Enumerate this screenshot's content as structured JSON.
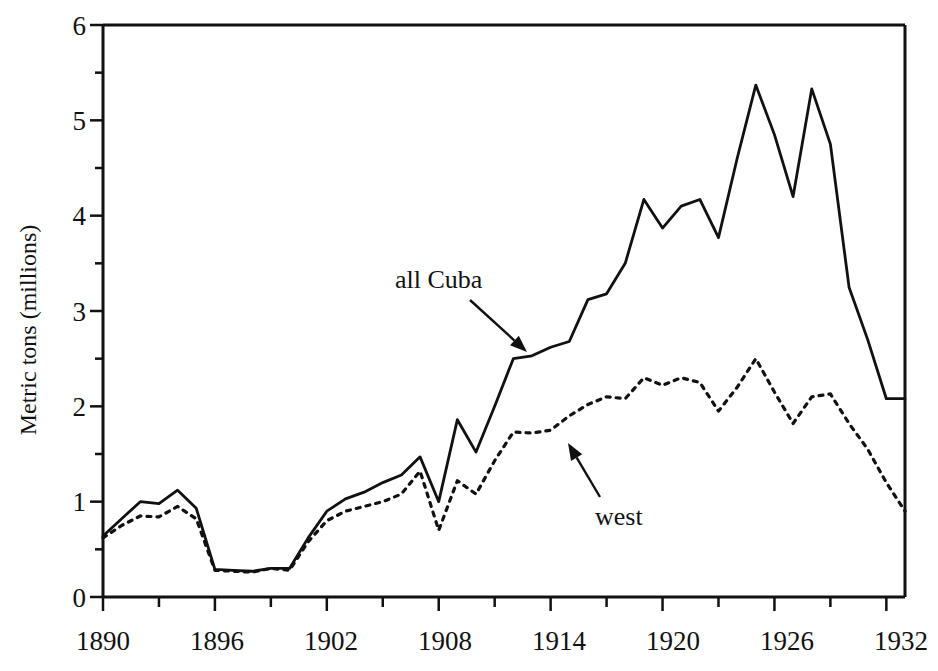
{
  "chart_data": {
    "type": "line",
    "title": "",
    "xlabel": "",
    "ylabel": "Metric tons (millions)",
    "xlim": [
      1890,
      1933
    ],
    "ylim": [
      0,
      6
    ],
    "grid": false,
    "legend_position": "inline-annotations",
    "x_major_ticks": [
      1890,
      1896,
      1902,
      1908,
      1914,
      1920,
      1926,
      1932
    ],
    "x_minor_tick_interval": 3,
    "y_major_ticks": [
      0,
      1,
      2,
      3,
      4,
      5,
      6
    ],
    "y_minor_tick_interval": 0.5,
    "x": [
      1890,
      1891,
      1892,
      1893,
      1894,
      1895,
      1896,
      1897,
      1898,
      1899,
      1900,
      1901,
      1902,
      1903,
      1904,
      1905,
      1906,
      1907,
      1908,
      1909,
      1910,
      1911,
      1912,
      1913,
      1914,
      1915,
      1916,
      1917,
      1918,
      1919,
      1920,
      1921,
      1922,
      1923,
      1924,
      1925,
      1926,
      1927,
      1928,
      1929,
      1930,
      1931,
      1932,
      1933
    ],
    "series": [
      {
        "name": "all Cuba",
        "style": "solid",
        "values": [
          0.64,
          0.82,
          1.0,
          0.98,
          1.12,
          0.93,
          0.29,
          0.28,
          0.27,
          0.3,
          0.3,
          0.62,
          0.9,
          1.03,
          1.1,
          1.2,
          1.28,
          1.47,
          1.0,
          1.86,
          1.52,
          2.0,
          2.5,
          2.53,
          2.62,
          2.68,
          3.12,
          3.18,
          3.5,
          4.17,
          3.87,
          4.1,
          4.17,
          3.77,
          4.6,
          5.37,
          4.85,
          4.2,
          5.33,
          4.75,
          3.25,
          2.7,
          2.08,
          2.08
        ]
      },
      {
        "name": "west",
        "style": "dotted",
        "values": [
          0.62,
          0.75,
          0.85,
          0.84,
          0.95,
          0.82,
          0.28,
          0.27,
          0.26,
          0.3,
          0.28,
          0.58,
          0.8,
          0.9,
          0.95,
          1.0,
          1.08,
          1.32,
          0.7,
          1.22,
          1.08,
          1.43,
          1.73,
          1.72,
          1.75,
          1.9,
          2.02,
          2.1,
          2.08,
          2.3,
          2.22,
          2.3,
          2.25,
          1.95,
          2.2,
          2.5,
          2.15,
          1.82,
          2.1,
          2.13,
          1.82,
          1.55,
          1.2,
          0.9
        ]
      }
    ],
    "annotations": [
      {
        "text": "all Cuba",
        "text_x": 395,
        "text_y": 288,
        "arrow_from_x": 470,
        "arrow_from_y": 300,
        "arrow_to_x": 527,
        "arrow_to_y": 352
      },
      {
        "text": "west",
        "text_x": 595,
        "text_y": 525,
        "arrow_from_x": 600,
        "arrow_from_y": 497,
        "arrow_to_x": 568,
        "arrow_to_y": 443
      }
    ]
  },
  "axis": {
    "y_tick_labels": [
      "6",
      "5",
      "4",
      "3",
      "2",
      "1",
      "0"
    ],
    "x_tick_labels": [
      "1890",
      "1896",
      "1902",
      "1908",
      "1914",
      "1920",
      "1926",
      "1932"
    ],
    "y_title": "Metric tons (millions)"
  }
}
